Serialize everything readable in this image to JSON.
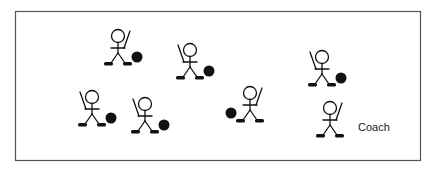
{
  "diagram": {
    "type": "drill-layout",
    "coach_label": "Coach",
    "colors": {
      "ink": "#111111",
      "border": "#555555"
    },
    "figures": [
      {
        "role": "player",
        "stick_side": "right",
        "ball_side": "right"
      },
      {
        "role": "player",
        "stick_side": "left",
        "ball_side": "right"
      },
      {
        "role": "player",
        "stick_side": "left",
        "ball_side": "right"
      },
      {
        "role": "player",
        "stick_side": "left",
        "ball_side": "right"
      },
      {
        "role": "player",
        "stick_side": "right",
        "ball_side": "left"
      },
      {
        "role": "player",
        "stick_side": "left",
        "ball_side": "right"
      },
      {
        "role": "coach",
        "stick_side": "right",
        "ball_side": "none"
      }
    ]
  }
}
